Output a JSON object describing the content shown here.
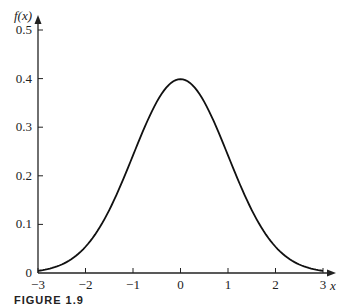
{
  "chart_data": {
    "type": "line",
    "title": "",
    "xlabel": "x",
    "ylabel": "f(x)",
    "xlim": [
      -3,
      3
    ],
    "ylim": [
      0,
      0.5
    ],
    "grid": false,
    "legend": null,
    "x_ticks": [
      "−3",
      "−2",
      "−1",
      "0",
      "1",
      "2",
      "3"
    ],
    "y_ticks": [
      "0",
      "0.1",
      "0.2",
      "0.3",
      "0.4",
      "0.5"
    ],
    "series": [
      {
        "name": "standard normal density",
        "x": [
          -3,
          -2.5,
          -2,
          -1.5,
          -1,
          -0.5,
          0,
          0.5,
          1,
          1.5,
          2,
          2.5,
          3
        ],
        "values": [
          0.004,
          0.018,
          0.054,
          0.13,
          0.242,
          0.352,
          0.399,
          0.352,
          0.242,
          0.13,
          0.054,
          0.018,
          0.004
        ]
      }
    ],
    "caption": "FIGURE 1.9"
  }
}
